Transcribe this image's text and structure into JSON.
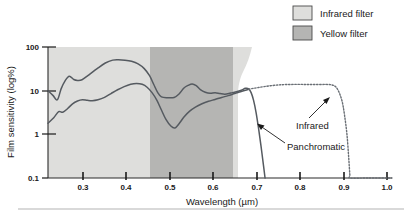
{
  "chart_data": {
    "type": "line",
    "title": "",
    "xlabel": "Wavelength (µm)",
    "ylabel": "Film sensitivity (log%)",
    "xlim": [
      0.22,
      1.06
    ],
    "ylim": [
      0.1,
      100
    ],
    "yscale": "log",
    "grid": false,
    "x_ticks": [
      0.3,
      0.4,
      0.5,
      0.6,
      0.7,
      0.8,
      0.9,
      1.0
    ],
    "x_tick_labels": [
      "0.3",
      "0.4",
      "0.5",
      "0.6",
      "0.7",
      "0.8",
      "0.9",
      "1.0"
    ],
    "y_ticks": [
      0.1,
      1,
      10,
      100
    ],
    "y_tick_labels": [
      "0.1",
      "1",
      "10",
      "100"
    ],
    "legend_position": "top-right",
    "series": [
      {
        "name": "Panchromatic",
        "style": "solid",
        "color": "#555a60",
        "points": [
          [
            0.22,
            10.0
          ],
          [
            0.232,
            7.8
          ],
          [
            0.243,
            6.2
          ],
          [
            0.252,
            11.0
          ],
          [
            0.262,
            17.0
          ],
          [
            0.272,
            21.5
          ],
          [
            0.283,
            18.0
          ],
          [
            0.292,
            17.2
          ],
          [
            0.303,
            17.8
          ],
          [
            0.32,
            23.0
          ],
          [
            0.34,
            32.0
          ],
          [
            0.36,
            43.0
          ],
          [
            0.378,
            50.0
          ],
          [
            0.392,
            51.0
          ],
          [
            0.408,
            50.0
          ],
          [
            0.424,
            47.0
          ],
          [
            0.44,
            41.0
          ],
          [
            0.455,
            32.0
          ],
          [
            0.468,
            22.0
          ],
          [
            0.478,
            14.0
          ],
          [
            0.488,
            9.0
          ],
          [
            0.497,
            7.2
          ],
          [
            0.512,
            6.9
          ],
          [
            0.528,
            7.0
          ],
          [
            0.54,
            8.4
          ],
          [
            0.552,
            11.5
          ],
          [
            0.562,
            13.2
          ],
          [
            0.572,
            14.3
          ],
          [
            0.582,
            13.0
          ],
          [
            0.592,
            10.6
          ],
          [
            0.604,
            9.2
          ],
          [
            0.616,
            8.7
          ],
          [
            0.628,
            9.0
          ],
          [
            0.64,
            8.6
          ],
          [
            0.652,
            8.3
          ],
          [
            0.666,
            8.8
          ],
          [
            0.68,
            9.4
          ],
          [
            0.692,
            10.2
          ],
          [
            0.702,
            11.3
          ],
          [
            0.71,
            11.0
          ],
          [
            0.716,
            9.0
          ],
          [
            0.722,
            6.0
          ],
          [
            0.728,
            3.2
          ],
          [
            0.734,
            1.4
          ],
          [
            0.74,
            0.55
          ],
          [
            0.746,
            0.2
          ],
          [
            0.75,
            0.1
          ]
        ]
      },
      {
        "name": "Infrared",
        "style": "solid-then-dotted",
        "color": "#555a60",
        "points": [
          [
            0.22,
            1.8
          ],
          [
            0.234,
            2.4
          ],
          [
            0.246,
            3.3
          ],
          [
            0.256,
            3.2
          ],
          [
            0.268,
            3.9
          ],
          [
            0.28,
            5.0
          ],
          [
            0.292,
            5.8
          ],
          [
            0.304,
            6.2
          ],
          [
            0.316,
            6.0
          ],
          [
            0.328,
            5.9
          ],
          [
            0.342,
            6.2
          ],
          [
            0.358,
            7.0
          ],
          [
            0.374,
            8.6
          ],
          [
            0.39,
            10.5
          ],
          [
            0.406,
            12.4
          ],
          [
            0.422,
            14.0
          ],
          [
            0.436,
            14.6
          ],
          [
            0.45,
            14.0
          ],
          [
            0.462,
            12.0
          ],
          [
            0.474,
            9.0
          ],
          [
            0.486,
            6.0
          ],
          [
            0.497,
            3.6
          ],
          [
            0.508,
            2.2
          ],
          [
            0.52,
            1.55
          ],
          [
            0.53,
            1.4
          ],
          [
            0.54,
            1.75
          ],
          [
            0.552,
            2.5
          ],
          [
            0.566,
            3.4
          ],
          [
            0.58,
            4.2
          ],
          [
            0.596,
            5.0
          ],
          [
            0.612,
            5.7
          ],
          [
            0.628,
            6.3
          ],
          [
            0.644,
            7.0
          ],
          [
            0.66,
            7.7
          ],
          [
            0.676,
            8.6
          ],
          [
            0.69,
            9.4
          ],
          [
            0.702,
            10.2
          ],
          [
            0.71,
            10.8
          ]
        ],
        "dotted_points": [
          [
            0.71,
            10.8
          ],
          [
            0.722,
            11.3
          ],
          [
            0.734,
            11.8
          ],
          [
            0.748,
            12.4
          ],
          [
            0.764,
            13.0
          ],
          [
            0.782,
            13.5
          ],
          [
            0.8,
            13.8
          ],
          [
            0.82,
            13.9
          ],
          [
            0.84,
            13.9
          ],
          [
            0.86,
            13.8
          ],
          [
            0.88,
            13.8
          ],
          [
            0.898,
            13.9
          ],
          [
            0.912,
            13.6
          ],
          [
            0.922,
            12.4
          ],
          [
            0.93,
            9.5
          ],
          [
            0.938,
            5.8
          ],
          [
            0.944,
            2.8
          ],
          [
            0.95,
            1.0
          ],
          [
            0.954,
            0.32
          ],
          [
            0.957,
            0.12
          ],
          [
            0.958,
            0.1
          ],
          [
            1.0,
            0.1
          ],
          [
            1.06,
            0.1
          ]
        ]
      }
    ],
    "shaded_regions": [
      {
        "name": "Infrared filter",
        "color": "#dededc",
        "x_start": 0.22,
        "x_end": 0.755,
        "note": "light gray band spanning full plot height, right edge tapers inward near the bottom"
      },
      {
        "name": "Yellow filter",
        "color": "#b5b5b3",
        "x_start": 0.49,
        "x_end": 0.712,
        "note": "darker gray band spanning full plot height"
      }
    ],
    "annotations": [
      {
        "text": "Panchromatic",
        "points_to_series": "Panchromatic"
      },
      {
        "text": "Infrared",
        "points_to_series": "Infrared"
      }
    ]
  },
  "legend": {
    "items": [
      {
        "label": "Infrared filter",
        "color": "#dededc"
      },
      {
        "label": "Yellow filter",
        "color": "#b5b5b3"
      }
    ]
  },
  "axes": {
    "x_title": "Wavelength (µm)",
    "y_title": "Film sensitivity (log%)",
    "x_tick_labels": [
      "0.3",
      "0.4",
      "0.5",
      "0.6",
      "0.7",
      "0.8",
      "0.9",
      "1.0"
    ],
    "y_tick_labels": [
      "100",
      "10",
      "1",
      "0.1"
    ]
  },
  "annotations": {
    "panchromatic": "Panchromatic",
    "infrared": "Infrared"
  },
  "colors": {
    "infrared_filter": "#dededc",
    "yellow_filter": "#b5b5b3",
    "curve": "#555a60",
    "axis": "#2b2b2b",
    "rule": "#b4b4b4"
  }
}
